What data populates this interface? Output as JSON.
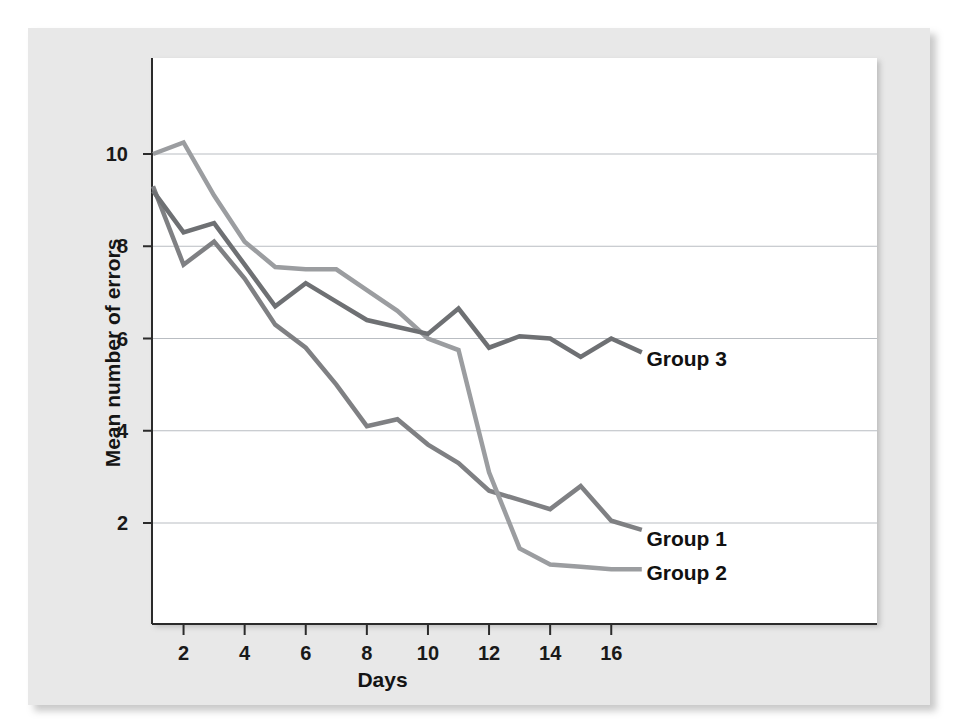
{
  "chart_data": {
    "type": "line",
    "title": "",
    "xlabel": "Days",
    "ylabel": "Mean number of errors",
    "xlim": [
      1,
      17
    ],
    "ylim": [
      0,
      11.3
    ],
    "xticks": [
      2,
      4,
      6,
      8,
      10,
      12,
      14,
      16
    ],
    "xtick_labels": [
      "2",
      "4",
      "6",
      "8",
      "10",
      "12",
      "14",
      "16"
    ],
    "yticks": [
      2,
      4,
      6,
      8,
      10
    ],
    "ytick_labels": [
      "2",
      "4",
      "6",
      "8",
      "10"
    ],
    "grid": "horizontal",
    "legend_position": "inline-right",
    "x": [
      1,
      2,
      3,
      4,
      5,
      6,
      7,
      8,
      9,
      10,
      11,
      12,
      13,
      14,
      15,
      16,
      17
    ],
    "series": [
      {
        "name": "Group 1",
        "color": "#7f8083",
        "label": "Group 1",
        "label_x": 17.15,
        "label_y": 1.65,
        "values": [
          9.3,
          7.6,
          8.1,
          7.3,
          6.3,
          5.8,
          5.0,
          4.1,
          4.25,
          3.7,
          3.3,
          2.7,
          2.5,
          2.3,
          2.8,
          2.05,
          1.85
        ]
      },
      {
        "name": "Group 2",
        "color": "#9b9da0",
        "label": "Group 2",
        "label_x": 17.15,
        "label_y": 0.92,
        "values": [
          10.0,
          10.25,
          9.1,
          8.1,
          7.55,
          7.5,
          7.5,
          7.05,
          6.6,
          6.0,
          5.75,
          3.1,
          1.45,
          1.1,
          1.05,
          1.0,
          1.0
        ]
      },
      {
        "name": "Group 3",
        "color": "#6e7073",
        "label": "Group 3",
        "label_x": 17.15,
        "label_y": 5.55,
        "values": [
          9.2,
          8.3,
          8.5,
          7.6,
          6.7,
          7.2,
          6.8,
          6.4,
          6.25,
          6.1,
          6.65,
          5.8,
          6.05,
          6.0,
          5.6,
          6.0,
          5.7
        ]
      }
    ]
  },
  "axes": {
    "y_title": "Mean number of errors",
    "x_title": "Days"
  }
}
